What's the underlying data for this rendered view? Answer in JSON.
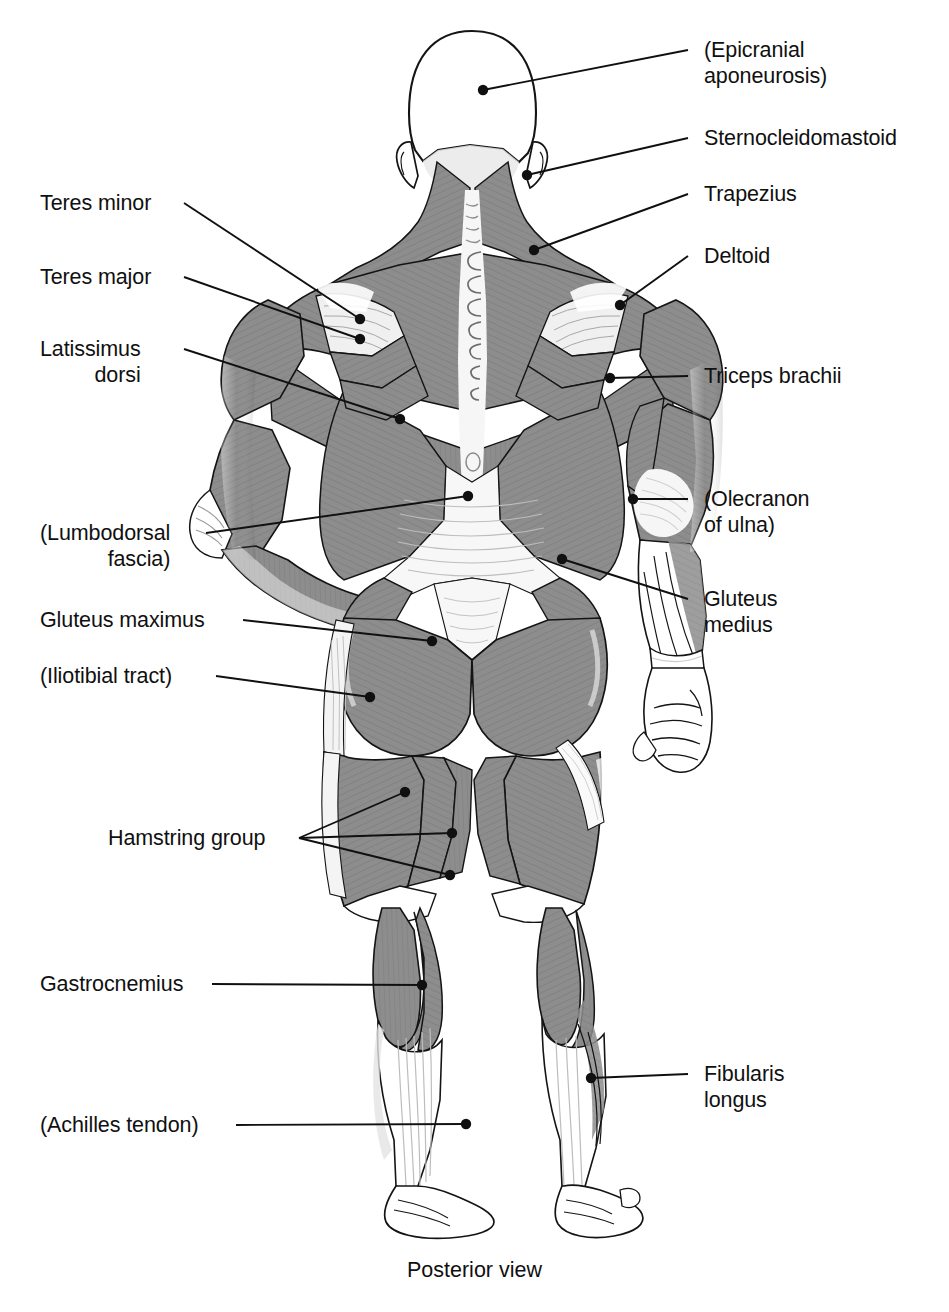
{
  "figure": {
    "caption": "Posterior view",
    "view": "posterior"
  },
  "colors": {
    "muscle_fill": "#8d8d8d",
    "muscle_dark": "#6f6f6f",
    "muscle_light": "#c8c8c8",
    "tendon": "#f2f2f2",
    "skin": "#ffffff",
    "outline": "#141414",
    "leader": "#101010",
    "text": "#101010",
    "background": "#ffffff"
  },
  "labels_right": [
    {
      "id": "epicranial-aponeurosis",
      "line1": "(Epicranial",
      "line2": "aponeurosis)",
      "x": 704,
      "y": 38,
      "dotx": 483,
      "doty": 90,
      "kneex": 688,
      "kneey": 50
    },
    {
      "id": "sternocleidomastoid",
      "line1": "Sternocleidomastoid",
      "line2": "",
      "x": 704,
      "y": 126,
      "dotx": 527,
      "doty": 175,
      "kneex": 688,
      "kneey": 138
    },
    {
      "id": "trapezius",
      "line1": "Trapezius",
      "line2": "",
      "x": 704,
      "y": 182,
      "dotx": 534,
      "doty": 250,
      "kneex": 688,
      "kneey": 194
    },
    {
      "id": "deltoid",
      "line1": "Deltoid",
      "line2": "",
      "x": 704,
      "y": 244,
      "dotx": 620,
      "doty": 305,
      "kneex": 688,
      "kneey": 256
    },
    {
      "id": "triceps-brachii",
      "line1": "Triceps brachii",
      "line2": "",
      "x": 704,
      "y": 364,
      "dotx": 610,
      "doty": 378,
      "kneex": 688,
      "kneey": 376
    },
    {
      "id": "olecranon-of-ulna",
      "line1": "(Olecranon",
      "line2": "of ulna)",
      "x": 704,
      "y": 487,
      "dotx": 633,
      "doty": 499,
      "kneex": 688,
      "kneey": 499
    },
    {
      "id": "gluteus-medius",
      "line1": "Gluteus",
      "line2": "medius",
      "x": 704,
      "y": 587,
      "dotx": 562,
      "doty": 559,
      "kneex": 688,
      "kneey": 599
    },
    {
      "id": "fibularis-longus",
      "line1": "Fibularis",
      "line2": "longus",
      "x": 704,
      "y": 1062,
      "dotx": 591,
      "doty": 1078,
      "kneex": 688,
      "kneey": 1074
    }
  ],
  "labels_left": [
    {
      "id": "teres-minor",
      "line1": "Teres minor",
      "line2": "",
      "x": 40,
      "y": 191,
      "dotx": 360,
      "doty": 319,
      "kneex": 184,
      "kneey": 203
    },
    {
      "id": "teres-major",
      "line1": "Teres major",
      "line2": "",
      "x": 40,
      "y": 265,
      "dotx": 360,
      "doty": 339,
      "kneex": 184,
      "kneey": 277
    },
    {
      "id": "latissimus-dorsi",
      "line1": "Latissimus",
      "line2": "dorsi",
      "x": 40,
      "y": 337,
      "dotx": 400,
      "doty": 419,
      "kneex": 184,
      "kneey": 349
    },
    {
      "id": "lumbodorsal-fascia",
      "line1": "(Lumbodorsal",
      "line2": "fascia)",
      "x": 40,
      "y": 521,
      "dotx": 468,
      "doty": 496,
      "kneex": 206,
      "kneey": 533
    },
    {
      "id": "gluteus-maximus",
      "line1": "Gluteus maximus",
      "line2": "",
      "x": 40,
      "y": 608,
      "dotx": 432,
      "doty": 641,
      "kneex": 243,
      "kneey": 620
    },
    {
      "id": "iliotibial-tract",
      "line1": "(Iliotibial tract)",
      "line2": "",
      "x": 40,
      "y": 664,
      "dotx": 370,
      "doty": 697,
      "kneex": 216,
      "kneey": 676
    },
    {
      "id": "hamstring-group",
      "line1": "Hamstring group",
      "line2": "",
      "x": 108,
      "y": 826,
      "dotx": 405,
      "doty": 792,
      "kneex": 299,
      "kneey": 838
    },
    {
      "id": "gastrocnemius",
      "line1": "Gastrocnemius",
      "line2": "",
      "x": 40,
      "y": 972,
      "dotx": 422,
      "doty": 985,
      "kneex": 212,
      "kneey": 984
    },
    {
      "id": "achilles-tendon",
      "line1": "(Achilles tendon)",
      "line2": "",
      "x": 40,
      "y": 1113,
      "dotx": 466,
      "doty": 1124,
      "kneex": 236,
      "kneey": 1125
    }
  ],
  "hamstring_extra_dots": [
    {
      "x": 452,
      "y": 833
    },
    {
      "x": 450,
      "y": 875
    }
  ],
  "structures": [
    "epicranial aponeurosis",
    "sternocleidomastoid",
    "trapezius",
    "deltoid",
    "teres minor",
    "teres major",
    "latissimus dorsi",
    "triceps brachii",
    "olecranon of ulna",
    "lumbodorsal fascia",
    "gluteus maximus",
    "gluteus medius",
    "iliotibial tract",
    "hamstring group",
    "gastrocnemius",
    "fibularis longus",
    "achilles tendon"
  ]
}
